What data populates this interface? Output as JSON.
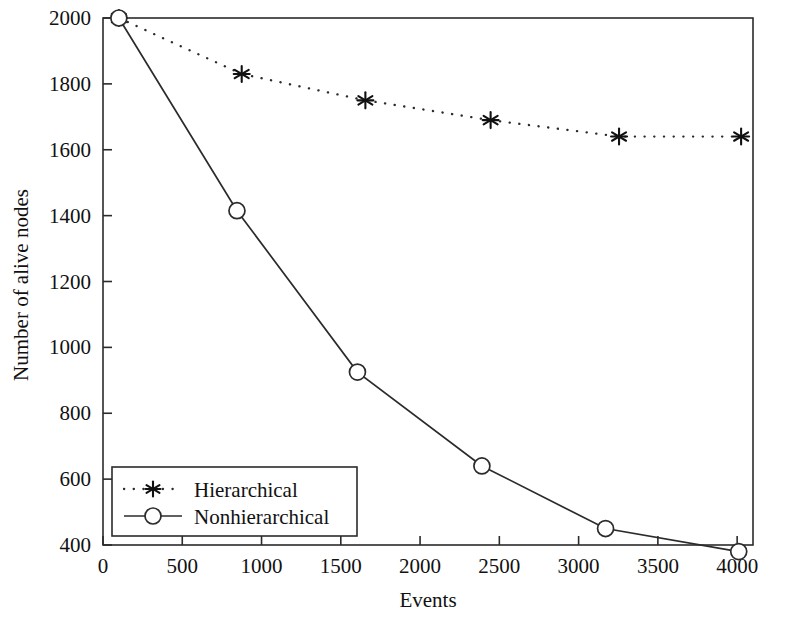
{
  "chart_data": {
    "type": "line",
    "title": "",
    "xlabel": "Events",
    "ylabel": "Number of alive nodes",
    "xlim": [
      0,
      4100
    ],
    "ylim": [
      400,
      2000
    ],
    "xticks": [
      0,
      500,
      1000,
      1500,
      2000,
      2500,
      3000,
      3500,
      4000
    ],
    "yticks": [
      400,
      600,
      800,
      1000,
      1200,
      1400,
      1600,
      1800,
      2000
    ],
    "xtick_labels": [
      "0",
      "500",
      "1000",
      "1500",
      "2000",
      "2500",
      "3000",
      "3500",
      "4000"
    ],
    "ytick_labels": [
      "400",
      "600",
      "800",
      "1000",
      "1200",
      "1400",
      "1600",
      "1800",
      "2000"
    ],
    "grid": false,
    "legend_position": "lower-left",
    "series": [
      {
        "name": "Hierarchical",
        "marker": "asterisk",
        "linestyle": "dotted",
        "color": "#2b2b2b",
        "x": [
          100,
          875,
          1655,
          2445,
          3255,
          4025
        ],
        "y": [
          2000,
          1830,
          1750,
          1690,
          1640,
          1640
        ]
      },
      {
        "name": "Nonhierarchical",
        "marker": "circle",
        "linestyle": "solid",
        "color": "#2b2b2b",
        "x": [
          100,
          845,
          1605,
          2390,
          3170,
          4010
        ],
        "y": [
          2000,
          1415,
          925,
          640,
          450,
          380
        ]
      }
    ]
  },
  "legend": {
    "entries": [
      {
        "label": "Hierarchical"
      },
      {
        "label": "Nonhierarchical"
      }
    ]
  },
  "axis": {
    "x_title": "Events",
    "y_title": "Number of alive nodes"
  }
}
